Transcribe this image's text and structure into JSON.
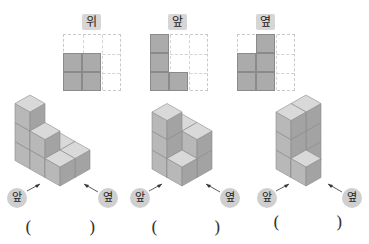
{
  "views": [
    {
      "label": "위",
      "filled": [
        [
          0,
          1
        ],
        [
          1,
          1
        ],
        [
          0,
          2
        ],
        [
          1,
          2
        ]
      ]
    },
    {
      "label": "앞",
      "filled": [
        [
          0,
          0
        ],
        [
          0,
          1
        ],
        [
          0,
          2
        ],
        [
          1,
          2
        ]
      ]
    },
    {
      "label": "옆",
      "filled": [
        [
          1,
          0
        ],
        [
          0,
          1
        ],
        [
          1,
          1
        ],
        [
          0,
          2
        ],
        [
          1,
          2
        ]
      ]
    }
  ],
  "figures": [
    {
      "front_label": "앞",
      "side_label": "옆"
    },
    {
      "front_label": "앞",
      "side_label": "옆"
    },
    {
      "front_label": "앞",
      "side_label": "옆"
    }
  ],
  "answers": [
    {
      "open": "(",
      "close": ")",
      "value": ""
    },
    {
      "open": "(",
      "close": ")",
      "value": ""
    },
    {
      "open": "(",
      "close": ")",
      "value": ""
    }
  ],
  "colors": {
    "cube_top": "#d9d9d9",
    "cube_left": "#b8b8b8",
    "cube_right": "#a3a3a3",
    "cube_edge": "#8c8c8c",
    "cell_fill": "#ababab",
    "label_bg": "#d6d6d6"
  }
}
